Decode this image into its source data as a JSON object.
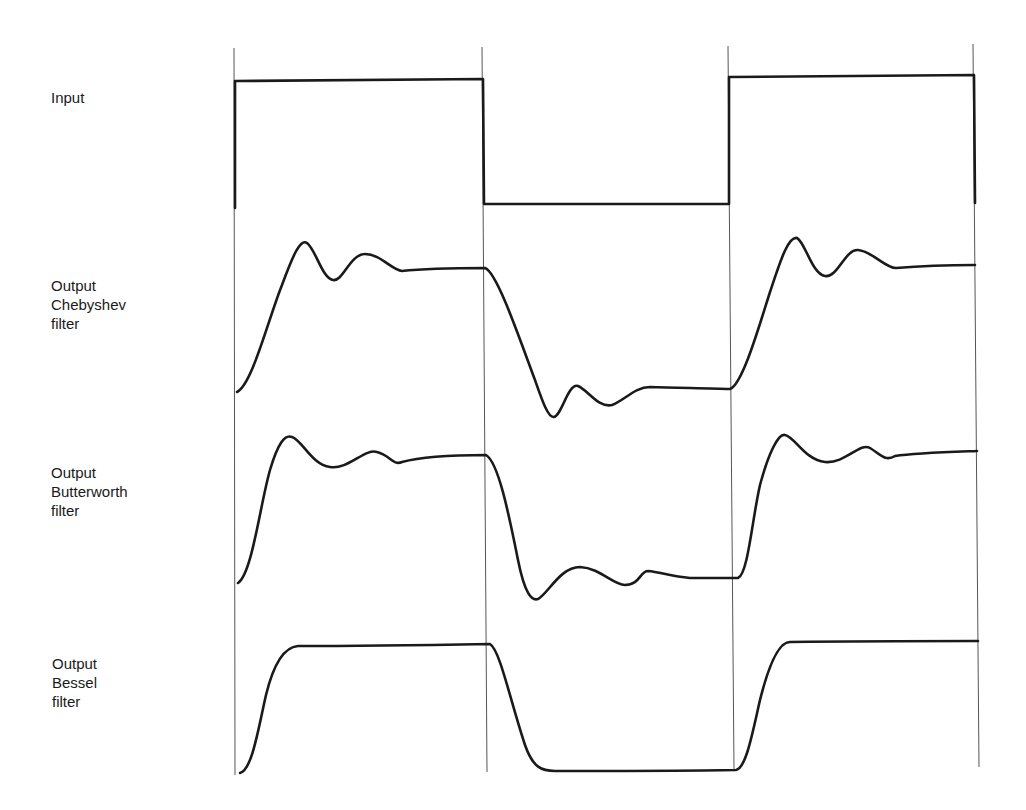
{
  "labels": {
    "input": [
      "Input"
    ],
    "chebyshev": [
      "Output",
      "Chebyshev",
      "filter"
    ],
    "butterworth": [
      "Output",
      "Butterworth",
      "filter"
    ],
    "bessel": [
      "Output",
      "Bessel",
      "filter"
    ]
  },
  "colors": {
    "line": "#1a1a1a",
    "guide": "#555555",
    "background": "#ffffff"
  },
  "guides_x": [
    234,
    483,
    731,
    975
  ]
}
